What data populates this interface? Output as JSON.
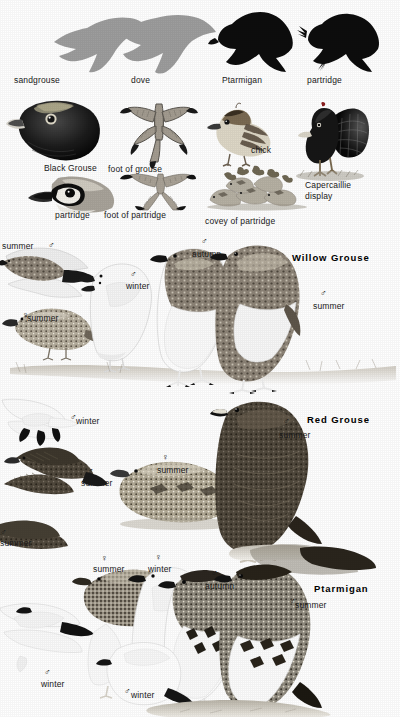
{
  "page": {
    "background_color": "#ffffff",
    "text_color": "#1a1a1a"
  },
  "silhouette_row": {
    "items": [
      {
        "label": "sandgrouse",
        "tone": "#9a9a9a",
        "icon": "flying-bird-silhouette"
      },
      {
        "label": "dove",
        "tone": "#9a9a9a",
        "icon": "flying-bird-silhouette"
      },
      {
        "label": "Ptarmigan",
        "tone": "#0d0d0d",
        "icon": "flying-bird-silhouette"
      },
      {
        "label": "partridge",
        "tone": "#0d0d0d",
        "icon": "flying-bird-silhouette"
      }
    ]
  },
  "detail_row": {
    "items": [
      {
        "label": "Black Grouse",
        "icon": "grouse-head-illustration"
      },
      {
        "label": "foot of grouse",
        "icon": "feathered-foot-illustration"
      },
      {
        "label": "chick",
        "icon": "grouse-chick-illustration"
      },
      {
        "label": "Capercaillie display",
        "icon": "capercaillie-display-illustration"
      },
      {
        "label": "partridge",
        "icon": "partridge-head-illustration"
      },
      {
        "label": "foot of partridge",
        "icon": "bare-foot-illustration"
      },
      {
        "label": "covey of partridge",
        "icon": "covey-of-partridge-illustration"
      }
    ]
  },
  "species_panels": [
    {
      "name": "Willow Grouse",
      "labels": [
        {
          "sex": "♂",
          "season": "summer",
          "note": "flying upper-left"
        },
        {
          "sex": "♂",
          "season": "winter",
          "note": "white standing bird"
        },
        {
          "sex": "♀",
          "season": "summer",
          "note": "crouching left bird"
        },
        {
          "sex": "♂",
          "season": "autumn",
          "note": "centre bird"
        },
        {
          "sex": "♂",
          "season": "summer",
          "note": "right standing bird"
        }
      ]
    },
    {
      "name": "Red Grouse",
      "labels": [
        {
          "sex": "♂",
          "season": "winter",
          "note": "white flying bird upper-left"
        },
        {
          "sex": "♂",
          "season": "summer",
          "note": "flying dark bird"
        },
        {
          "sex": "♀",
          "season": "summer",
          "note": "crouching centre bird"
        },
        {
          "sex": "♂",
          "season": "summer",
          "note": "right standing bird"
        },
        {
          "sex": "♂",
          "season": "summer",
          "note": "lower-left flying bird"
        }
      ]
    },
    {
      "name": "Ptarmigan",
      "labels": [
        {
          "sex": "♀",
          "season": "summer",
          "note": "left mottled bird"
        },
        {
          "sex": "♀",
          "season": "winter",
          "note": "white bird behind"
        },
        {
          "sex": "♂",
          "season": "autumn",
          "note": "centre bird"
        },
        {
          "sex": "♂",
          "season": "summer",
          "note": "right standing bird"
        },
        {
          "sex": "♂",
          "season": "winter",
          "note": "lower-left flying bird"
        },
        {
          "sex": "♂",
          "season": "winter",
          "note": "lower-centre bird"
        }
      ]
    }
  ],
  "text": {
    "sandgrouse": "sandgrouse",
    "dove": "dove",
    "ptarmigan_sil": "Ptarmigan",
    "partridge_sil": "partridge",
    "black_grouse": "Black Grouse",
    "foot_of_grouse": "foot of grouse",
    "chick": "chick",
    "capercaillie_display": "Capercaillie display",
    "partridge_head": "partridge",
    "foot_of_partridge": "foot of partridge",
    "covey_of_partridge": "covey of partridge",
    "willow_grouse": "Willow Grouse",
    "red_grouse": "Red Grouse",
    "ptarmigan": "Ptarmigan",
    "summer": "summer",
    "winter": "winter",
    "autumn": "autumn",
    "male": "♂",
    "female": "♀"
  }
}
